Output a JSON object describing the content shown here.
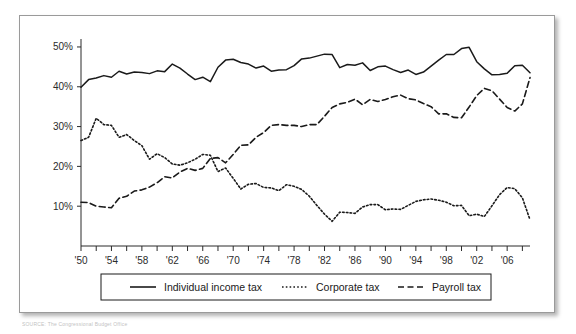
{
  "figure": {
    "source_note": "SOURCE: The Congressional Budget Office"
  },
  "axes": {
    "y_ticks": [
      "10%",
      "20%",
      "30%",
      "40%",
      "50%"
    ],
    "x_ticks": [
      "'50",
      "'54",
      "'58",
      "'62",
      "'66",
      "'70",
      "'74",
      "'78",
      "'82",
      "'86",
      "'90",
      "'94",
      "'98",
      "'02",
      "'06"
    ]
  },
  "legend": {
    "items": [
      {
        "label": "Individual income tax",
        "style": "solid",
        "color": "#1a1a1a"
      },
      {
        "label": "Corporate tax",
        "style": "dotted",
        "color": "#1a1a1a"
      },
      {
        "label": "Payroll tax",
        "style": "dashed",
        "color": "#1a1a1a"
      }
    ]
  },
  "chart_data": {
    "type": "line",
    "title": "",
    "xlabel": "",
    "ylabel": "",
    "xlim": [
      1950,
      2009
    ],
    "ylim": [
      0,
      52
    ],
    "ytick_values": [
      10,
      20,
      30,
      40,
      50
    ],
    "xtick_values": [
      1950,
      1954,
      1958,
      1962,
      1966,
      1970,
      1974,
      1978,
      1982,
      1986,
      1990,
      1994,
      1998,
      2002,
      2006
    ],
    "minor_tick_interval": 2,
    "grid": false,
    "legend_position": "below",
    "x": [
      1950,
      1951,
      1952,
      1953,
      1954,
      1955,
      1956,
      1957,
      1958,
      1959,
      1960,
      1961,
      1962,
      1963,
      1964,
      1965,
      1966,
      1967,
      1968,
      1969,
      1970,
      1971,
      1972,
      1973,
      1974,
      1975,
      1976,
      1977,
      1978,
      1979,
      1980,
      1981,
      1982,
      1983,
      1984,
      1985,
      1986,
      1987,
      1988,
      1989,
      1990,
      1991,
      1992,
      1993,
      1994,
      1995,
      1996,
      1997,
      1998,
      1999,
      2000,
      2001,
      2002,
      2003,
      2004,
      2005,
      2006,
      2007,
      2008,
      2009
    ],
    "series": [
      {
        "name": "Individual income tax",
        "style": "solid",
        "color": "#1a1a1a",
        "values": [
          39.9,
          41.8,
          42.2,
          42.8,
          42.4,
          43.9,
          43.2,
          43.7,
          43.6,
          43.3,
          44.0,
          43.8,
          45.7,
          44.7,
          43.2,
          41.8,
          42.4,
          41.3,
          44.9,
          46.7,
          46.9,
          46.1,
          45.7,
          44.7,
          45.2,
          43.9,
          44.2,
          44.3,
          45.3,
          47.0,
          47.2,
          47.7,
          48.2,
          48.1,
          44.8,
          45.6,
          45.4,
          46.0,
          44.1,
          45.0,
          45.2,
          44.3,
          43.6,
          44.2,
          43.1,
          43.7,
          45.2,
          46.7,
          48.1,
          48.1,
          49.6,
          49.9,
          46.3,
          44.5,
          43.0,
          43.1,
          43.4,
          45.3,
          45.4,
          43.5
        ]
      },
      {
        "name": "Corporate tax",
        "style": "dotted",
        "color": "#1a1a1a",
        "values": [
          26.5,
          27.3,
          32.1,
          30.5,
          30.3,
          27.3,
          28.0,
          26.5,
          25.2,
          21.8,
          23.2,
          22.2,
          20.6,
          20.3,
          20.9,
          21.8,
          23.0,
          22.8,
          18.7,
          19.6,
          17.0,
          14.3,
          15.5,
          15.7,
          14.7,
          14.6,
          13.9,
          15.4,
          15.0,
          14.2,
          12.5,
          10.2,
          8.0,
          6.2,
          8.5,
          8.4,
          8.2,
          9.8,
          10.4,
          10.4,
          9.1,
          9.3,
          9.2,
          10.2,
          11.2,
          11.6,
          11.8,
          11.5,
          11.0,
          10.1,
          10.2,
          7.6,
          8.0,
          7.4,
          10.1,
          12.9,
          14.7,
          14.4,
          12.1,
          6.6
        ]
      },
      {
        "name": "Payroll tax",
        "style": "dashed",
        "color": "#1a1a1a",
        "values": [
          11.0,
          10.9,
          10.0,
          9.8,
          9.6,
          12.0,
          12.5,
          13.8,
          14.1,
          14.8,
          15.9,
          17.4,
          17.1,
          18.6,
          19.5,
          19.0,
          19.5,
          22.0,
          22.2,
          20.9,
          23.0,
          25.3,
          25.4,
          27.3,
          28.5,
          30.3,
          30.5,
          30.3,
          30.3,
          30.0,
          30.5,
          30.5,
          32.6,
          34.8,
          35.7,
          36.1,
          36.9,
          35.5,
          36.8,
          36.3,
          36.8,
          37.5,
          37.9,
          37.0,
          36.7,
          35.8,
          35.0,
          33.2,
          33.2,
          32.3,
          32.2,
          34.9,
          37.8,
          39.6,
          39.0,
          36.9,
          34.8,
          33.9,
          35.7,
          42.3
        ]
      }
    ]
  }
}
